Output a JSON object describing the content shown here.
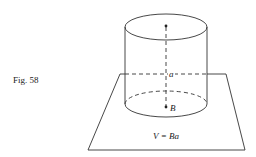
{
  "figure": {
    "caption": "Fig. 58",
    "labels": {
      "height": "a",
      "base": "B",
      "formula": "V = Ba"
    },
    "colors": {
      "stroke": "#333333",
      "text": "#222222",
      "background": "#ffffff"
    },
    "shapes": {
      "cylinder": "right circular cylinder standing on a plane",
      "plane": "parallelogram base plane",
      "axis": "dashed vertical axis from top center to base center"
    }
  }
}
